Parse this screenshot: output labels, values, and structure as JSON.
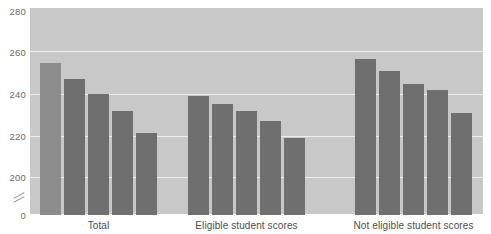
{
  "chart_data": {
    "type": "bar",
    "title": "",
    "subtitle": "",
    "xlabel": "",
    "ylabel": "",
    "categories": [
      "Total",
      "Eligible student scores",
      "Not eligible student scores"
    ],
    "series": [
      {
        "name": "bar-1",
        "values": [
          255,
          239,
          257
        ]
      },
      {
        "name": "bar-2",
        "values": [
          247,
          235,
          251
        ]
      },
      {
        "name": "bar-3",
        "values": [
          240,
          232,
          245
        ]
      },
      {
        "name": "bar-4",
        "values": [
          232,
          227,
          242
        ]
      },
      {
        "name": "bar-5",
        "values": [
          221,
          219,
          231
        ]
      }
    ],
    "bars": [
      {
        "group": "Total",
        "index": 0,
        "value": 255,
        "shade": "light"
      },
      {
        "group": "Total",
        "index": 1,
        "value": 247,
        "shade": "dark"
      },
      {
        "group": "Total",
        "index": 2,
        "value": 240,
        "shade": "dark"
      },
      {
        "group": "Total",
        "index": 3,
        "value": 232,
        "shade": "dark"
      },
      {
        "group": "Total",
        "index": 4,
        "value": 221,
        "shade": "dark"
      },
      {
        "group": "Eligible student scores",
        "index": 0,
        "value": 239,
        "shade": "dark"
      },
      {
        "group": "Eligible student scores",
        "index": 1,
        "value": 235,
        "shade": "dark"
      },
      {
        "group": "Eligible student scores",
        "index": 2,
        "value": 232,
        "shade": "dark"
      },
      {
        "group": "Eligible student scores",
        "index": 3,
        "value": 227,
        "shade": "dark"
      },
      {
        "group": "Eligible student scores",
        "index": 4,
        "value": 219,
        "shade": "dark"
      },
      {
        "group": "Not eligible student scores",
        "index": 0,
        "value": 257,
        "shade": "dark"
      },
      {
        "group": "Not eligible student scores",
        "index": 1,
        "value": 251,
        "shade": "dark"
      },
      {
        "group": "Not eligible student scores",
        "index": 2,
        "value": 245,
        "shade": "dark"
      },
      {
        "group": "Not eligible student scores",
        "index": 3,
        "value": 242,
        "shade": "dark"
      },
      {
        "group": "Not eligible student scores",
        "index": 4,
        "value": 231,
        "shade": "dark"
      }
    ],
    "ytick_labels": [
      "280",
      "260",
      "240",
      "220",
      "200",
      "0"
    ],
    "ytick_values": [
      280,
      260,
      240,
      220,
      200,
      0
    ],
    "ylim": [
      195,
      285
    ],
    "axis_break": true,
    "grid": true,
    "legend": "none",
    "colors": {
      "plot_background": "#c8c8c8",
      "bar_dark": "#6f6f6f",
      "bar_light": "#8c8c8c",
      "gridline": "#eeeeee",
      "tick_text": "#6b6b6b",
      "label_text": "#4d4d4d"
    }
  },
  "axis": {
    "y_ticks": [
      {
        "label": "280"
      },
      {
        "label": "260"
      },
      {
        "label": "240"
      },
      {
        "label": "220"
      },
      {
        "label": "200"
      },
      {
        "label": "0"
      }
    ]
  },
  "groups": [
    {
      "label": "Total"
    },
    {
      "label": "Eligible student scores"
    },
    {
      "label": "Not eligible student scores"
    }
  ]
}
